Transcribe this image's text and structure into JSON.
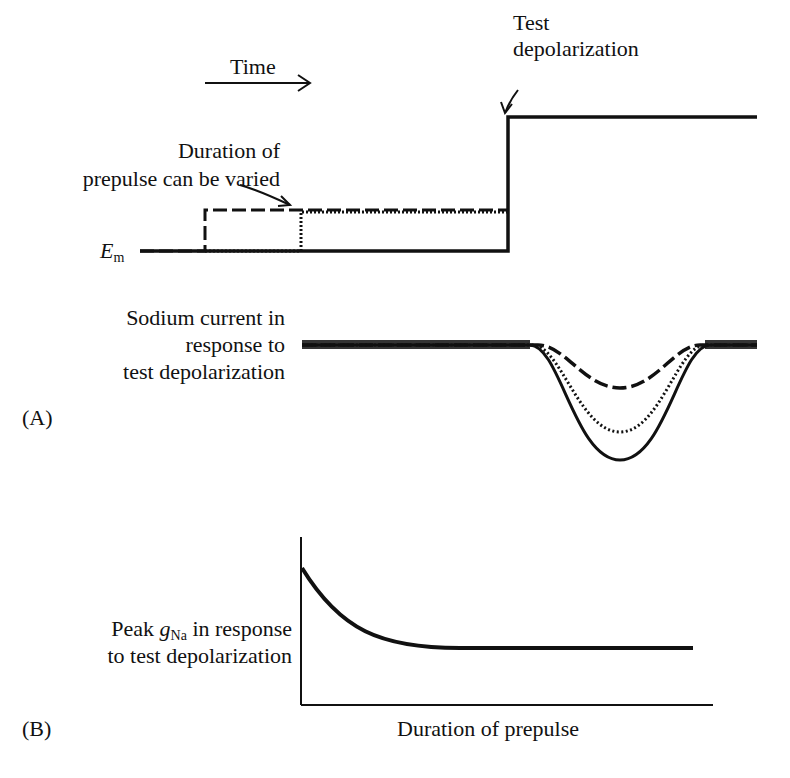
{
  "panel_a": {
    "label": "(A)",
    "time_label": "Time",
    "test_label_line1": "Test",
    "test_label_line2": "depolarization",
    "duration_label_line1": "Duration of",
    "duration_label_line2": "prepulse can be varied",
    "em_label": "E",
    "em_sub": "m",
    "current_label_line1": "Sodium current in",
    "current_label_line2": "response to",
    "current_label_line3": "test depolarization",
    "traces": [
      {
        "style": "dashed",
        "prepulse": "long",
        "peak_current": "smallest"
      },
      {
        "style": "dotted",
        "prepulse": "short",
        "peak_current": "intermediate"
      },
      {
        "style": "solid",
        "prepulse": "none",
        "peak_current": "largest"
      }
    ]
  },
  "panel_b": {
    "label": "(B)",
    "ylabel_pre": "Peak ",
    "ylabel_g": "g",
    "ylabel_sub": "Na",
    "ylabel_post": " in response",
    "ylabel_line2": "to test depolarization",
    "xlabel": "Duration of prepulse",
    "curve": "exponential decay from high initial value to a plateau"
  },
  "colors": {
    "ink": "#111111",
    "background": "#ffffff"
  }
}
